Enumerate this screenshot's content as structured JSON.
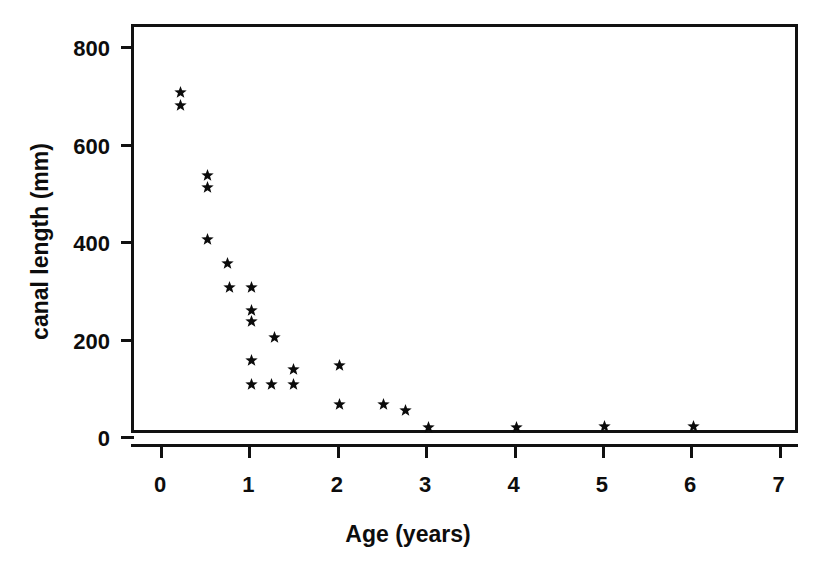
{
  "chart_data": {
    "type": "scatter",
    "title": "",
    "xlabel": "Age (years)",
    "ylabel": "canal length (mm)",
    "xlim": [
      -0.33,
      7.22
    ],
    "ylim": [
      0,
      840
    ],
    "xticks": [
      0,
      1,
      2,
      3,
      4,
      5,
      6,
      7
    ],
    "xtick_labels": [
      "0",
      "1",
      "2",
      "3",
      "4",
      "5",
      "6",
      "7"
    ],
    "yticks": [
      0,
      200,
      400,
      600,
      800
    ],
    "ytick_labels": [
      "0",
      "200",
      "400",
      "600",
      "800"
    ],
    "grid": false,
    "legend": null,
    "marker": "star",
    "marker_color": "#0b0b0b",
    "frame_color": "#111111",
    "background": "#ffffff",
    "points": [
      {
        "x": 0.2,
        "y": 705
      },
      {
        "x": 0.2,
        "y": 678
      },
      {
        "x": 0.5,
        "y": 534
      },
      {
        "x": 0.5,
        "y": 511
      },
      {
        "x": 0.5,
        "y": 403
      },
      {
        "x": 0.73,
        "y": 355
      },
      {
        "x": 0.75,
        "y": 304
      },
      {
        "x": 1.0,
        "y": 304
      },
      {
        "x": 1.0,
        "y": 257
      },
      {
        "x": 1.0,
        "y": 236
      },
      {
        "x": 1.26,
        "y": 203
      },
      {
        "x": 1.0,
        "y": 156
      },
      {
        "x": 1.0,
        "y": 105
      },
      {
        "x": 1.23,
        "y": 105
      },
      {
        "x": 1.48,
        "y": 136
      },
      {
        "x": 1.48,
        "y": 105
      },
      {
        "x": 2.0,
        "y": 144
      },
      {
        "x": 2.0,
        "y": 64
      },
      {
        "x": 2.49,
        "y": 64
      },
      {
        "x": 2.74,
        "y": 53
      },
      {
        "x": 3.0,
        "y": 18
      },
      {
        "x": 4.0,
        "y": 18
      },
      {
        "x": 5.0,
        "y": 20
      },
      {
        "x": 6.0,
        "y": 20
      }
    ]
  },
  "figure": {
    "x_axis_title": "Age (years)",
    "y_axis_title": "canal length (mm)"
  }
}
